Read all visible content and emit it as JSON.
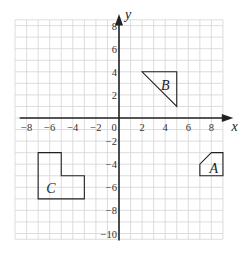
{
  "diagram": {
    "type": "coordinate-grid",
    "axes": {
      "x_label": "x",
      "y_label": "y",
      "x_range": [
        -9,
        9
      ],
      "y_range": [
        -10.5,
        8.5
      ],
      "x_ticks": [
        {
          "value": -8,
          "label": "−8"
        },
        {
          "value": -6,
          "label": "−6"
        },
        {
          "value": -4,
          "label": "−4"
        },
        {
          "value": -2,
          "label": "−2"
        },
        {
          "value": 0,
          "label": "0"
        },
        {
          "value": 2,
          "label": "2"
        },
        {
          "value": 4,
          "label": "4"
        },
        {
          "value": 6,
          "label": "6"
        },
        {
          "value": 8,
          "label": "8"
        }
      ],
      "y_ticks": [
        {
          "value": 8,
          "label": "8"
        },
        {
          "value": 6,
          "label": "6"
        },
        {
          "value": 4,
          "label": "4"
        },
        {
          "value": 2,
          "label": "2"
        },
        {
          "value": -2,
          "label": "−2"
        },
        {
          "value": -4,
          "label": "−4"
        },
        {
          "value": -6,
          "label": "−6"
        },
        {
          "value": -8,
          "label": "−8"
        },
        {
          "value": -10,
          "label": "−10"
        }
      ]
    },
    "grid": {
      "step": 1,
      "color": "#d4d4d4"
    },
    "colors": {
      "axis": "#222222",
      "shape_stroke": "#222222",
      "grid": "#d4d4d4"
    },
    "shapes": [
      {
        "name": "A",
        "label": "A",
        "vertices": [
          [
            7,
            -5
          ],
          [
            9,
            -5
          ],
          [
            9,
            -3
          ],
          [
            8,
            -3
          ],
          [
            7,
            -4
          ]
        ],
        "label_pos": [
          8.2,
          -4.3
        ]
      },
      {
        "name": "B",
        "label": "B",
        "vertices": [
          [
            2,
            4
          ],
          [
            5,
            4
          ],
          [
            5,
            1
          ]
        ],
        "label_pos": [
          4.0,
          2.9
        ]
      },
      {
        "name": "C",
        "label": "C",
        "vertices": [
          [
            -7,
            -3
          ],
          [
            -5,
            -3
          ],
          [
            -5,
            -5
          ],
          [
            -3,
            -5
          ],
          [
            -3,
            -7
          ],
          [
            -7,
            -7
          ]
        ],
        "label_pos": [
          -5.9,
          -6.1
        ]
      }
    ]
  }
}
